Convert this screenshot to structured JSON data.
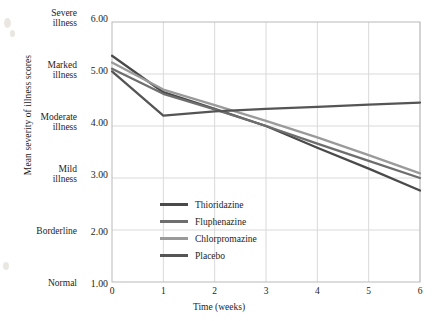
{
  "axis": {
    "ylabel": "Mean severity of illness scores",
    "xlabel": "Time (weeks)",
    "y_ticks": [
      {
        "value": "6.00",
        "category_line1": "Severe",
        "category_line2": "illness"
      },
      {
        "value": "5.00",
        "category_line1": "Marked",
        "category_line2": "illness"
      },
      {
        "value": "4.00",
        "category_line1": "Moderate",
        "category_line2": "illness"
      },
      {
        "value": "3.00",
        "category_line1": "Mild",
        "category_line2": "illness"
      },
      {
        "value": "2.00",
        "category_line1": "Borderline",
        "category_line2": ""
      },
      {
        "value": "1.00",
        "category_line1": "Normal",
        "category_line2": ""
      }
    ],
    "x_ticks": [
      "0",
      "1",
      "2",
      "3",
      "4",
      "5",
      "6"
    ]
  },
  "legend": {
    "items": [
      {
        "label": "Thioridazine",
        "color": "#4a4a4a"
      },
      {
        "label": "Fluphenazine",
        "color": "#6e6e6e"
      },
      {
        "label": "Chlorpromazine",
        "color": "#9a9a9a"
      },
      {
        "label": "Placebo",
        "color": "#555555"
      }
    ]
  },
  "chart_data": {
    "type": "line",
    "title": "",
    "xlabel": "Time (weeks)",
    "ylabel": "Mean severity of illness scores",
    "x": [
      0,
      1,
      2,
      3,
      4,
      5,
      6
    ],
    "xlim": [
      0,
      6
    ],
    "ylim": [
      1.0,
      6.0
    ],
    "grid": true,
    "legend_position": "inside-lower-left",
    "y_tick_values": [
      1.0,
      2.0,
      3.0,
      4.0,
      5.0,
      6.0
    ],
    "y_tick_categories": [
      "Normal",
      "Borderline",
      "Mild illness",
      "Moderate illness",
      "Marked illness",
      "Severe illness"
    ],
    "series": [
      {
        "name": "Thioridazine",
        "color": "#4a4a4a",
        "values": [
          5.35,
          4.65,
          4.33,
          4.0,
          3.58,
          3.18,
          2.76
        ]
      },
      {
        "name": "Fluphenazine",
        "color": "#6e6e6e",
        "values": [
          5.1,
          4.62,
          4.32,
          4.0,
          3.66,
          3.33,
          3.0
        ]
      },
      {
        "name": "Chlorpromazine",
        "color": "#9a9a9a",
        "values": [
          5.22,
          4.7,
          4.4,
          4.1,
          3.78,
          3.44,
          3.09
        ]
      },
      {
        "name": "Placebo",
        "color": "#555555",
        "values": [
          5.05,
          4.2,
          4.28,
          4.33,
          4.37,
          4.41,
          4.45
        ]
      }
    ]
  }
}
